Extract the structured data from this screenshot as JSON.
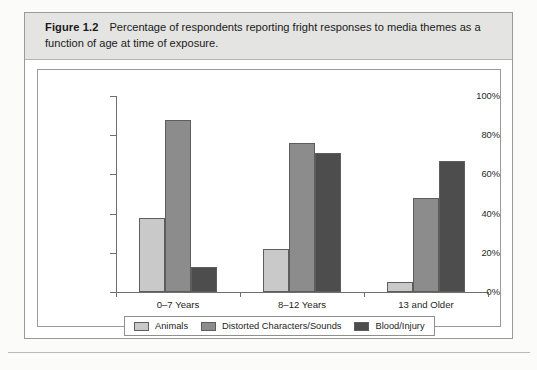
{
  "figure": {
    "label": "Figure 1.2",
    "caption": "Percentage of respondents reporting fright responses to media themes as a function of age at time of exposure."
  },
  "chart_data": {
    "type": "bar",
    "title": "Percentage of respondents reporting fright responses to media themes as a function of age at time of exposure.",
    "xlabel": "",
    "ylabel": "",
    "categories": [
      "0–7 Years",
      "8–12 Years",
      "13 and Older"
    ],
    "series": [
      {
        "name": "Animals",
        "color": "#c9c9c9",
        "values": [
          38,
          22,
          5
        ]
      },
      {
        "name": "Distorted Characters/Sounds",
        "color": "#8c8c8c",
        "values": [
          88,
          76,
          48
        ]
      },
      {
        "name": "Blood/Injury",
        "color": "#4d4d4d",
        "values": [
          13,
          71,
          67
        ]
      }
    ],
    "ylim": [
      0,
      100
    ],
    "ytick_values": [
      0,
      20,
      40,
      60,
      80,
      100
    ],
    "ytick_labels": [
      "0%",
      "20%",
      "40%",
      "60%",
      "80%",
      "100%"
    ],
    "grid": false,
    "legend_position": "bottom"
  }
}
